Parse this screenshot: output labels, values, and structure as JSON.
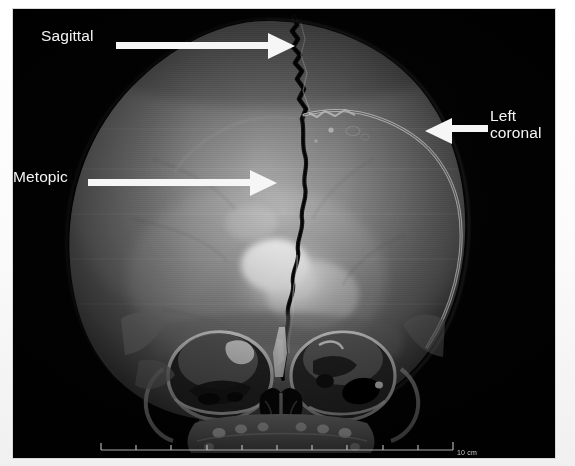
{
  "image": {
    "modality": "3D CT volume rendering",
    "view": "anteroposterior (frontal) skull"
  },
  "annotations": [
    {
      "id": "sagittal",
      "label": "Sagittal",
      "arrow_direction": "right",
      "target": "midline sagittal suture at vertex"
    },
    {
      "id": "metopic",
      "label": "Metopic",
      "arrow_direction": "right",
      "target": "midline metopic suture on frontal bone"
    },
    {
      "id": "left-coronal",
      "label": "Left\ncoronal",
      "arrow_direction": "left",
      "target": "left coronal suture along lateral skull margin"
    }
  ],
  "scale_bar": {
    "label": "10 cm",
    "tick_count": 11
  },
  "colors": {
    "panel_background": "#040404",
    "annotation": "#f4f4f4",
    "bone_mid": "#8d8d8d",
    "bone_bright": "#ffffff",
    "suture_dark": "#1b1b1b"
  }
}
